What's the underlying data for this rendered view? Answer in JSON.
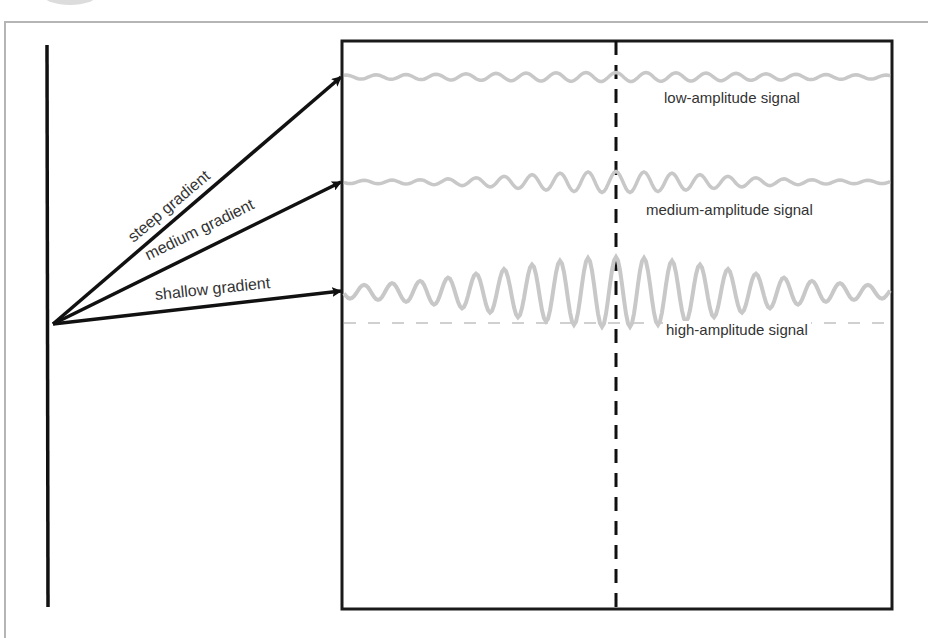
{
  "diagram": {
    "type": "gradient-to-signal-amplitude",
    "colors": {
      "frame": "#b5b5b5",
      "axis": "#111111",
      "box": "#1a1a1a",
      "signal": "#c8c8c8",
      "baseline_dash": "#d0d0d0",
      "text": "#333333"
    },
    "gradients": [
      {
        "id": "steep",
        "label": "steep gradient",
        "target_signal": "low"
      },
      {
        "id": "medium",
        "label": "medium gradient",
        "target_signal": "medium"
      },
      {
        "id": "shallow",
        "label": "shallow gradient",
        "target_signal": "high"
      }
    ],
    "signals": [
      {
        "id": "low",
        "label": "low-amplitude signal"
      },
      {
        "id": "medium",
        "label": "medium-amplitude signal"
      },
      {
        "id": "high",
        "label": "high-amplitude signal"
      }
    ]
  }
}
